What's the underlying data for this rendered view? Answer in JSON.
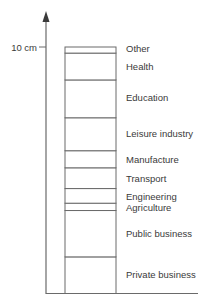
{
  "axis": {
    "unit": "cm",
    "tick_label": "10 cm",
    "tick_value": 10
  },
  "chart_data": {
    "type": "bar",
    "title": "",
    "stacked": true,
    "ylabel": "",
    "ylim": [
      0,
      10
    ],
    "segments": [
      {
        "name": "Private business",
        "value": 1.5
      },
      {
        "name": "Public business",
        "value": 1.9
      },
      {
        "name": "Agriculture",
        "value": 0.3
      },
      {
        "name": "Engineering",
        "value": 0.6
      },
      {
        "name": "Transport",
        "value": 0.85
      },
      {
        "name": "Manufacture",
        "value": 0.7
      },
      {
        "name": "Leisure industry",
        "value": 1.35
      },
      {
        "name": "Education",
        "value": 1.55
      },
      {
        "name": "Health",
        "value": 1.1
      },
      {
        "name": "Other",
        "value": 0.25
      }
    ]
  }
}
